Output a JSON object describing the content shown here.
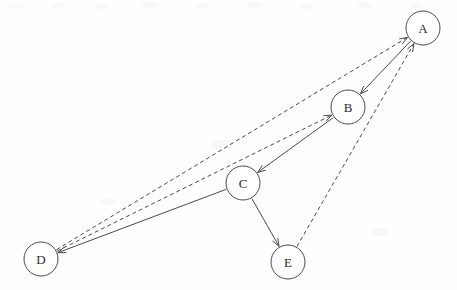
{
  "diagram": {
    "width": 457,
    "height": 290,
    "background_color": "#fefefe",
    "stroke_color": "#4a4a4a",
    "label_color": "#2b2b2b",
    "node_radius": 17,
    "nodes": [
      {
        "id": "A",
        "label": "A",
        "cx": 423,
        "cy": 28
      },
      {
        "id": "B",
        "label": "B",
        "cx": 348,
        "cy": 107
      },
      {
        "id": "C",
        "label": "C",
        "cx": 243,
        "cy": 183
      },
      {
        "id": "D",
        "label": "D",
        "cx": 41,
        "cy": 259
      },
      {
        "id": "E",
        "label": "E",
        "cx": 288,
        "cy": 262
      }
    ],
    "edges": [
      {
        "id": "A-B",
        "from": "A",
        "to": "B",
        "style": "solid",
        "directed": true
      },
      {
        "id": "B-C",
        "from": "B",
        "to": "C",
        "style": "solid",
        "directed": true
      },
      {
        "id": "C-D",
        "from": "C",
        "to": "D",
        "style": "solid",
        "directed": true
      },
      {
        "id": "C-E",
        "from": "C",
        "to": "E",
        "style": "solid",
        "directed": true
      },
      {
        "id": "D-A",
        "from": "D",
        "to": "A",
        "style": "dashed",
        "directed": true
      },
      {
        "id": "D-B",
        "from": "D",
        "to": "B",
        "style": "dashed",
        "directed": true
      },
      {
        "id": "E-A",
        "from": "E",
        "to": "A",
        "style": "dashed",
        "directed": true
      }
    ]
  }
}
